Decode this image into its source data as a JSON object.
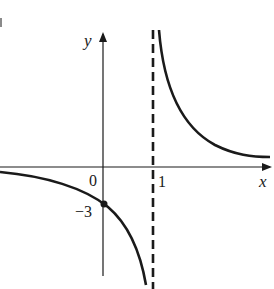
{
  "graph": {
    "function": "y = 3/(x - 1)",
    "axes": {
      "x_label": "x",
      "y_label": "y"
    },
    "labels": {
      "origin": "0",
      "x_tick": "1",
      "y_intercept": "−3",
      "corner_mark": "i"
    },
    "asymptotes": {
      "vertical": "x = 1",
      "horizontal": "y = 0"
    },
    "marked_point": {
      "x": 0,
      "y": -3
    },
    "colors": {
      "ink": "#1a1a1a",
      "background": "#ffffff"
    }
  }
}
